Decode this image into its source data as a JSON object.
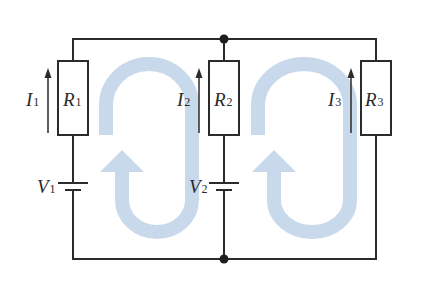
{
  "diagram": {
    "type": "circuit",
    "colors": {
      "wire": "#2b2b2b",
      "loop_arrow": "#c9d9ec",
      "background": "#ffffff"
    },
    "branches": [
      {
        "id": "left",
        "resistor": {
          "symbol": "R",
          "subscript": "1"
        },
        "current": {
          "symbol": "I",
          "subscript": "1",
          "direction": "up"
        },
        "battery": {
          "symbol": "V",
          "subscript": "1"
        }
      },
      {
        "id": "middle",
        "resistor": {
          "symbol": "R",
          "subscript": "2"
        },
        "current": {
          "symbol": "I",
          "subscript": "2",
          "direction": "up"
        },
        "battery": {
          "symbol": "V",
          "subscript": "2"
        }
      },
      {
        "id": "right",
        "resistor": {
          "symbol": "R",
          "subscript": "3"
        },
        "current": {
          "symbol": "I",
          "subscript": "3",
          "direction": "up"
        },
        "battery": null
      }
    ],
    "junctions": [
      "top-middle",
      "bottom-middle"
    ],
    "loops": [
      {
        "id": "loop-1",
        "between": [
          "left",
          "middle"
        ],
        "direction": "clockwise"
      },
      {
        "id": "loop-2",
        "between": [
          "middle",
          "right"
        ],
        "direction": "clockwise"
      }
    ]
  },
  "labels": {
    "I1": {
      "sym": "I",
      "sub": "1"
    },
    "I2": {
      "sym": "I",
      "sub": "2"
    },
    "I3": {
      "sym": "I",
      "sub": "3"
    },
    "R1": {
      "sym": "R",
      "sub": "1"
    },
    "R2": {
      "sym": "R",
      "sub": "2"
    },
    "R3": {
      "sym": "R",
      "sub": "3"
    },
    "V1": {
      "sym": "V",
      "sub": "1"
    },
    "V2": {
      "sym": "V",
      "sub": "2"
    }
  }
}
